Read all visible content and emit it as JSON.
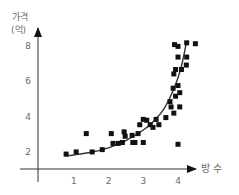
{
  "chart_data": {
    "type": "scatter",
    "title": "",
    "xlabel": "방 수",
    "ylabel": "가격 (억)",
    "ylabel_lines": [
      "가격",
      "(억)"
    ],
    "x_ticks": [
      1,
      2,
      3,
      4
    ],
    "y_ticks": [
      2,
      4,
      6,
      8
    ],
    "xlim": [
      0,
      4.6
    ],
    "ylim": [
      1,
      8.6
    ],
    "grid": false,
    "legend": null,
    "series": [
      {
        "name": "data points",
        "marker": "square",
        "points": [
          [
            0.78,
            1.85
          ],
          [
            1.07,
            1.97
          ],
          [
            1.36,
            3.0
          ],
          [
            1.53,
            1.97
          ],
          [
            1.82,
            2.1
          ],
          [
            2.08,
            3.0
          ],
          [
            2.13,
            2.45
          ],
          [
            2.28,
            2.45
          ],
          [
            2.4,
            2.5
          ],
          [
            2.45,
            3.1
          ],
          [
            2.48,
            2.85
          ],
          [
            2.68,
            2.9
          ],
          [
            2.7,
            2.5
          ],
          [
            2.76,
            2.5
          ],
          [
            2.85,
            3.0
          ],
          [
            2.9,
            3.5
          ],
          [
            3.0,
            2.5
          ],
          [
            3.0,
            3.8
          ],
          [
            3.1,
            3.75
          ],
          [
            3.2,
            3.5
          ],
          [
            3.28,
            3.35
          ],
          [
            3.37,
            3.8
          ],
          [
            3.45,
            3.5
          ],
          [
            3.65,
            3.9
          ],
          [
            3.77,
            4.8
          ],
          [
            3.8,
            4.5
          ],
          [
            3.88,
            4.15
          ],
          [
            4.0,
            2.4
          ],
          [
            4.05,
            4.5
          ],
          [
            3.93,
            5.1
          ],
          [
            3.86,
            5.55
          ],
          [
            4.05,
            5.3
          ],
          [
            4.0,
            5.7
          ],
          [
            3.88,
            6.35
          ],
          [
            3.93,
            6.6
          ],
          [
            4.1,
            6.6
          ],
          [
            4.0,
            7.3
          ],
          [
            4.24,
            6.85
          ],
          [
            4.25,
            7.3
          ],
          [
            3.9,
            8.0
          ],
          [
            4.0,
            7.9
          ],
          [
            4.25,
            8.1
          ],
          [
            4.5,
            8.05
          ]
        ]
      },
      {
        "name": "trend curve",
        "type": "line",
        "points": [
          [
            0.75,
            1.75
          ],
          [
            1.0,
            1.8
          ],
          [
            1.5,
            1.95
          ],
          [
            2.0,
            2.2
          ],
          [
            2.5,
            2.6
          ],
          [
            3.0,
            3.2
          ],
          [
            3.3,
            3.7
          ],
          [
            3.6,
            4.4
          ],
          [
            3.9,
            5.6
          ],
          [
            4.1,
            6.8
          ],
          [
            4.25,
            8.2
          ]
        ]
      }
    ]
  }
}
